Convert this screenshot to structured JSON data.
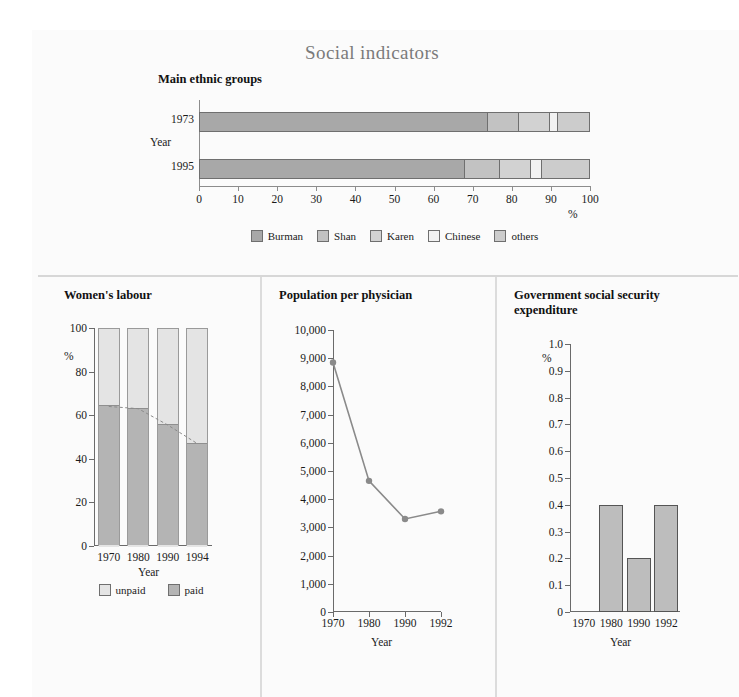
{
  "figure": {
    "title": "Social indicators"
  },
  "ethnic": {
    "title": "Main ethnic groups",
    "y_axis_label": "Year",
    "x_axis_label": "%",
    "colors": {
      "Burman": "#a8a8a8",
      "Shan": "#c2c2c2",
      "Karen": "#d2d2d2",
      "Chinese": "#f2f2f2",
      "others": "#cccccc"
    },
    "legend": [
      "Burman",
      "Shan",
      "Karen",
      "Chinese",
      "others"
    ],
    "chart_data": {
      "type": "bar",
      "orientation": "horizontal",
      "stacked": true,
      "title": "Main ethnic groups",
      "categories": [
        "1973",
        "1995"
      ],
      "xlabel": "%",
      "ylabel": "Year",
      "xlim": [
        0,
        100
      ],
      "xticks": [
        0,
        10,
        20,
        30,
        40,
        50,
        60,
        70,
        80,
        90,
        100
      ],
      "grid": false,
      "legend_position": "bottom",
      "series": [
        {
          "name": "Burman",
          "values": [
            74,
            68
          ]
        },
        {
          "name": "Shan",
          "values": [
            8,
            9
          ]
        },
        {
          "name": "Karen",
          "values": [
            8,
            8
          ]
        },
        {
          "name": "Chinese",
          "values": [
            2,
            3
          ]
        },
        {
          "name": "others",
          "values": [
            8,
            12
          ]
        }
      ]
    }
  },
  "women": {
    "title": "Women's labour",
    "legend": [
      "unpaid",
      "paid"
    ],
    "colors": {
      "unpaid": "#e4e4e4",
      "paid": "#b4b4b4"
    },
    "chart_data": {
      "type": "bar",
      "stacked": true,
      "title": "Women's labour",
      "categories": [
        "1970",
        "1980",
        "1990",
        "1994"
      ],
      "xlabel": "Year",
      "ylabel": "%",
      "ylim": [
        0,
        100
      ],
      "yticks": [
        0,
        20,
        40,
        60,
        80,
        100
      ],
      "grid": false,
      "legend_position": "bottom",
      "series": [
        {
          "name": "paid",
          "values": [
            64,
            63,
            55.5,
            47
          ]
        },
        {
          "name": "unpaid",
          "values": [
            36,
            37,
            44.5,
            53
          ]
        }
      ],
      "annotations": [
        {
          "type": "dashed-connector",
          "follows": "paid",
          "values": [
            64,
            63,
            55.5,
            47
          ]
        }
      ]
    }
  },
  "population": {
    "title": "Population per physician",
    "chart_data": {
      "type": "line",
      "title": "Population per physician",
      "x": [
        "1970",
        "1980",
        "1990",
        "1992"
      ],
      "values": [
        8850,
        4650,
        3300,
        3570
      ],
      "xlabel": "Year",
      "ylabel": "",
      "ylim": [
        0,
        10000
      ],
      "yticks": [
        0,
        1000,
        2000,
        3000,
        4000,
        5000,
        6000,
        7000,
        8000,
        9000,
        10000
      ],
      "ytick_labels": [
        "0",
        "1,000",
        "2,000",
        "3,000",
        "4,000",
        "5,000",
        "6,000",
        "7,000",
        "8,000",
        "9,000",
        "10,000"
      ],
      "grid": false,
      "marker": "circle",
      "color": "#8a8a8a"
    }
  },
  "government": {
    "title": "Government social security expenditure",
    "title_line1": "Government social security",
    "title_line2": "expenditure",
    "chart_data": {
      "type": "bar",
      "title": "Government social security expenditure",
      "categories": [
        "1970",
        "1980",
        "1990",
        "1992"
      ],
      "values": [
        0,
        0.4,
        0.2,
        0.4
      ],
      "xlabel": "Year",
      "ylabel": "%",
      "ylim": [
        0,
        1.0
      ],
      "yticks": [
        0,
        0.1,
        0.2,
        0.3,
        0.4,
        0.5,
        0.6,
        0.7,
        0.8,
        0.9,
        1.0
      ],
      "ytick_labels": [
        "0",
        "0.1",
        "0.2",
        "0.3",
        "0.4",
        "0.5",
        "0.6",
        "0.7",
        "0.8",
        "0.9",
        "1.0"
      ],
      "grid": false,
      "color": "#bdbdbd"
    }
  }
}
